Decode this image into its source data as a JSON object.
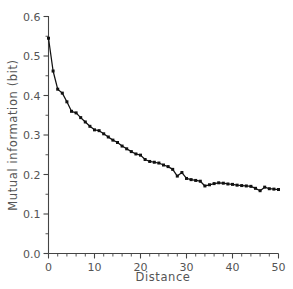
{
  "chart_data": {
    "type": "line",
    "title": "",
    "xlabel": "Distance",
    "ylabel": "Mutual information (bit)",
    "xlim": [
      0,
      50
    ],
    "ylim": [
      0.0,
      0.6
    ],
    "grid": false,
    "legend": "none",
    "marker": "square",
    "line_color": "#111111",
    "axis_color": "#555555",
    "background_color": "#ffffff",
    "spines": [
      "left",
      "bottom"
    ],
    "xticks": [
      0,
      10,
      20,
      30,
      40,
      50
    ],
    "xtick_labels": [
      "0",
      "10",
      "20",
      "30",
      "40",
      "50"
    ],
    "xminor_step": 2,
    "yticks": [
      0.0,
      0.1,
      0.2,
      0.3,
      0.4,
      0.5,
      0.6
    ],
    "ytick_labels": [
      "0.0",
      "0.1",
      "0.2",
      "0.3",
      "0.4",
      "0.5",
      "0.6"
    ],
    "yminor_step": 0.05,
    "series": [
      {
        "name": "mutual information",
        "x": [
          0,
          1,
          2,
          3,
          4,
          5,
          6,
          7,
          8,
          9,
          10,
          11,
          12,
          13,
          14,
          15,
          16,
          17,
          18,
          19,
          20,
          21,
          22,
          23,
          24,
          25,
          26,
          27,
          28,
          29,
          30,
          31,
          32,
          33,
          34,
          35,
          36,
          37,
          38,
          39,
          40,
          41,
          42,
          43,
          44,
          45,
          46,
          47,
          48,
          49,
          50
        ],
        "values": [
          0.545,
          0.462,
          0.416,
          0.406,
          0.384,
          0.36,
          0.356,
          0.344,
          0.333,
          0.322,
          0.313,
          0.311,
          0.303,
          0.295,
          0.287,
          0.281,
          0.272,
          0.265,
          0.258,
          0.252,
          0.249,
          0.238,
          0.233,
          0.231,
          0.229,
          0.224,
          0.22,
          0.213,
          0.196,
          0.205,
          0.19,
          0.187,
          0.185,
          0.183,
          0.171,
          0.174,
          0.177,
          0.179,
          0.178,
          0.176,
          0.175,
          0.173,
          0.172,
          0.171,
          0.17,
          0.165,
          0.159,
          0.168,
          0.164,
          0.163,
          0.162
        ]
      }
    ]
  },
  "axes": {
    "xlabel": "Distance",
    "ylabel": "Mutual information (bit)"
  }
}
